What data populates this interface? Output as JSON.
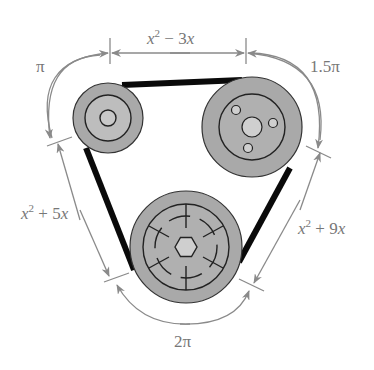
{
  "diagram": {
    "colors": {
      "pulley_outer": "#a9a9a9",
      "pulley_inner": "#b9b9b9",
      "hub": "#cfcfcf",
      "belt": "#0a0a0a",
      "dimension": "#8a8a8a",
      "label": "#777777"
    },
    "pulleys": [
      {
        "name": "top-left",
        "cx": 108,
        "cy": 118,
        "r": 35
      },
      {
        "name": "top-right",
        "cx": 252,
        "cy": 127,
        "r": 50
      },
      {
        "name": "bottom",
        "cx": 186,
        "cy": 247,
        "r": 56
      }
    ],
    "labels": {
      "top_segment": {
        "var": "x",
        "exp": "2",
        "rest": " − 3",
        "var2": "x"
      },
      "left_segment": {
        "var": "x",
        "exp": "2",
        "rest": " + 5",
        "var2": "x"
      },
      "right_segment": {
        "var": "x",
        "exp": "2",
        "rest": " + 9",
        "var2": "x"
      },
      "arc_top_left": "π",
      "arc_top_right": "1.5π",
      "arc_bottom": "2π"
    }
  }
}
